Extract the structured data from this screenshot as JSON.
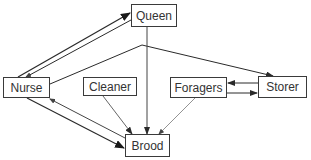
{
  "diagram": {
    "type": "flow",
    "nodes": [
      {
        "id": "queen",
        "label": "Queen",
        "x": 131,
        "y": 4,
        "w": 46,
        "h": 23
      },
      {
        "id": "nurse",
        "label": "Nurse",
        "x": 3,
        "y": 77,
        "w": 47,
        "h": 21
      },
      {
        "id": "cleaner",
        "label": "Cleaner",
        "x": 83,
        "y": 77,
        "w": 54,
        "h": 19
      },
      {
        "id": "foragers",
        "label": "Foragers",
        "x": 170,
        "y": 77,
        "w": 57,
        "h": 21
      },
      {
        "id": "storer",
        "label": "Storer",
        "x": 258,
        "y": 76,
        "w": 49,
        "h": 22
      },
      {
        "id": "brood",
        "label": "Brood",
        "x": 125,
        "y": 134,
        "w": 45,
        "h": 23
      }
    ],
    "edges": [
      {
        "from": "nurse",
        "to": "queen",
        "weight": "heavy"
      },
      {
        "from": "queen",
        "to": "nurse",
        "weight": "light"
      },
      {
        "from": "nurse",
        "to": "storer",
        "weight": "normal"
      },
      {
        "from": "queen",
        "to": "brood",
        "weight": "normal"
      },
      {
        "from": "nurse",
        "to": "brood",
        "weight": "heavy"
      },
      {
        "from": "brood",
        "to": "nurse",
        "weight": "light"
      },
      {
        "from": "cleaner",
        "to": "brood",
        "weight": "normal"
      },
      {
        "from": "foragers",
        "to": "brood",
        "weight": "light"
      },
      {
        "from": "storer",
        "to": "foragers",
        "weight": "normal"
      },
      {
        "from": "foragers",
        "to": "storer",
        "weight": "normal"
      }
    ]
  },
  "colors": {
    "stroke": "#2a2a2a",
    "light_stroke": "#777777",
    "text": "#333333"
  }
}
